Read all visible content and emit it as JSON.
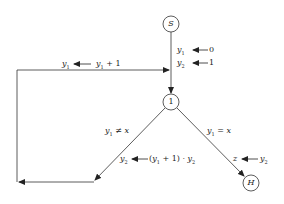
{
  "diagram": {
    "type": "flowchart",
    "nodes": [
      {
        "id": "S",
        "label": "S",
        "role": "start"
      },
      {
        "id": "1",
        "label": "1",
        "role": "decision"
      },
      {
        "id": "H",
        "label": "H",
        "role": "halt"
      }
    ],
    "edges": [
      {
        "from": "S",
        "to": "1",
        "assignments": [
          "y1 ← 0",
          "y2 ← 1"
        ]
      },
      {
        "from": "1",
        "to": "1",
        "condition": "y1 ≠ x",
        "assignments": [
          "y2 ← (y1 + 1) · y2",
          "y1 ← y1 + 1"
        ]
      },
      {
        "from": "1",
        "to": "H",
        "condition": "y1 = x",
        "assignments": [
          "z ← y2"
        ]
      }
    ]
  },
  "labels": {
    "start": "S",
    "decision": "1",
    "halt": "H",
    "init_y1_var": "y",
    "init_y1_sub": "1",
    "init_y1_val": "0",
    "init_y2_var": "y",
    "init_y2_sub": "2",
    "init_y2_val": "1",
    "loop_lhs_var": "y",
    "loop_lhs_sub": "1",
    "loop_rhs_var": "y",
    "loop_rhs_sub": "1",
    "loop_rhs_rest": " + 1",
    "cond_ne_var": "y",
    "cond_ne_sub": "1",
    "cond_ne_op": " ≠ ",
    "cond_ne_rhs": "x",
    "upd_lhs_var": "y",
    "upd_lhs_sub": "2",
    "upd_rhs_open": "(",
    "upd_rhs_var1": "y",
    "upd_rhs_sub1": "1",
    "upd_rhs_mid": " + 1) · ",
    "upd_rhs_var2": "y",
    "upd_rhs_sub2": "2",
    "cond_eq_var": "y",
    "cond_eq_sub": "1",
    "cond_eq_op": " = ",
    "cond_eq_rhs": "x",
    "out_lhs": "z",
    "out_rhs_var": "y",
    "out_rhs_sub": "2"
  }
}
